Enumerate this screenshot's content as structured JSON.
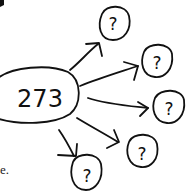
{
  "diagram": {
    "center_node": {
      "label": "273"
    },
    "unknown_nodes": [
      {
        "label": "?"
      },
      {
        "label": "?"
      },
      {
        "label": "?"
      },
      {
        "label": "?"
      },
      {
        "label": "?"
      }
    ],
    "edge_count": 5
  },
  "text_fragments": {
    "line1": "e",
    "line2": "e."
  },
  "colors": {
    "ink": "#111111",
    "background": "#ffffff"
  }
}
